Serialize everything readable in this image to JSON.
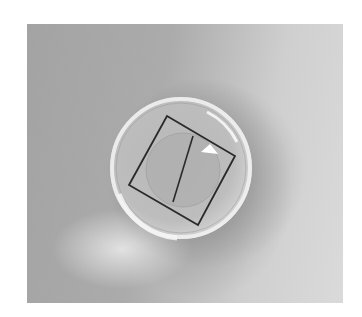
{
  "image": {
    "description": "Photograph of a clear glass dome magnifier resting on a gray surface over a tilted drawn square containing a vertical line and a faint circle",
    "colors": {
      "background_left": "#a3a3a3",
      "background_right": "#dadada",
      "dome_rim": "#e8e8e8",
      "square_stroke": "#2a2a2a",
      "highlight": "#ffffff"
    }
  }
}
